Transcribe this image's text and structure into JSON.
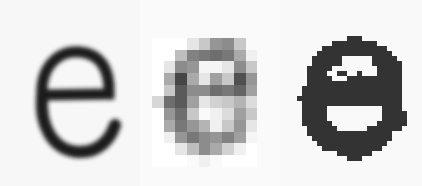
{
  "figure": {
    "panels": [
      {
        "id": "original",
        "description": "blurred scanned letter e",
        "letter": "e"
      },
      {
        "id": "grayscale",
        "description": "low-resolution grayscale pixelated letter e",
        "letter": "e"
      },
      {
        "id": "binary",
        "description": "binarized thresholded letter e",
        "letter": "e"
      }
    ],
    "colors": {
      "ink": "#1a1a1a",
      "binary_ink": "#333333",
      "background": "#f8f8f8"
    },
    "grayscale_grid": {
      "origin": [
        12,
        38
      ],
      "cell": 11.7,
      "rows": [
        [
          255,
          255,
          255,
          230,
          200,
          150,
          140,
          200,
          250
        ],
        [
          255,
          255,
          190,
          130,
          120,
          110,
          120,
          170,
          240
        ],
        [
          255,
          230,
          140,
          150,
          245,
          245,
          230,
          140,
          200
        ],
        [
          255,
          170,
          70,
          170,
          230,
          160,
          200,
          80,
          150
        ],
        [
          255,
          200,
          90,
          140,
          140,
          110,
          120,
          100,
          160
        ],
        [
          215,
          110,
          90,
          160,
          230,
          210,
          200,
          180,
          220
        ],
        [
          255,
          150,
          110,
          200,
          250,
          240,
          220,
          160,
          200
        ],
        [
          255,
          170,
          120,
          150,
          180,
          240,
          200,
          150,
          230
        ],
        [
          255,
          240,
          150,
          120,
          140,
          150,
          130,
          160,
          245
        ],
        [
          255,
          255,
          230,
          190,
          140,
          170,
          210,
          240,
          255
        ],
        [
          255,
          255,
          255,
          250,
          240,
          250,
          255,
          255,
          255
        ]
      ]
    },
    "binary_grid": {
      "origin": [
        17,
        36
      ],
      "cell": 5,
      "rows": [
        "..........###..........",
        ".......#########.......",
        ".....#############.....",
        "....###############....",
        "...######......#####...",
        "...######......######..",
        "..#####.........#####..",
        "..####..##..#...#####..",
        "..#####...###########..",
        "..###################..",
        ".####################..",
        ".####################..",
        "#####################..",
        ".####################..",
        ".#####...........####..",
        ".#####...........#####.",
        ".#####...........#####.",
        ".######.........######.",
        "..######......#######..",
        "..#################....",
        "...################....",
        "....##############.....",
        ".....############......",
        "........#######........",
        "..........###.........."
      ]
    }
  }
}
